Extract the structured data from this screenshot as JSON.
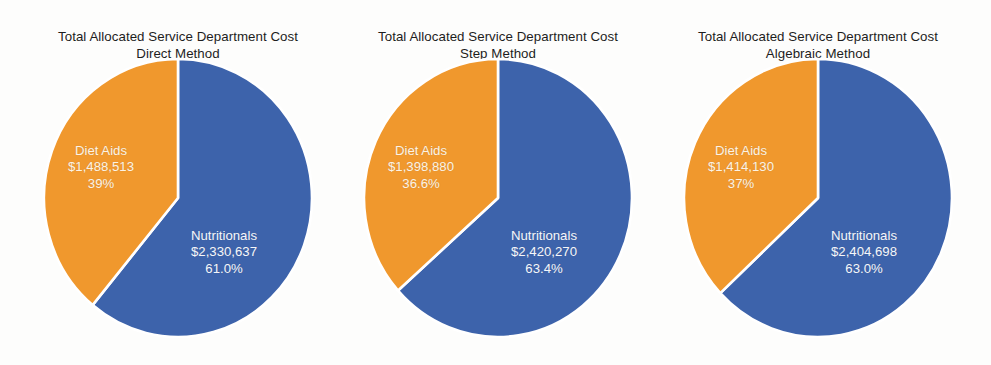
{
  "page": {
    "background": "#fdfdfc",
    "colors": {
      "nutritionals": "#3d63ab",
      "diet_aids": "#f0982d",
      "separator": "#ffffff",
      "title_text": "#1d1d1d",
      "label_text": "#ffffff"
    }
  },
  "chart_data": [
    {
      "type": "pie",
      "title": "Total Allocated Service Department Cost",
      "subtitle": "Direct Method",
      "start_angle_deg": 0,
      "direction": "clockwise",
      "center": {
        "cx": 165,
        "cy": 198
      },
      "radius": {
        "rx": 134,
        "ry": 139
      },
      "labels": [
        "Nutritionals",
        "Diet Aids"
      ],
      "values": [
        2330637,
        1488513
      ],
      "value_labels": [
        "$2,330,637",
        "$1,488,513"
      ],
      "percent_labels": [
        "61.0%",
        "39%"
      ],
      "percents": [
        61.0,
        39.0
      ],
      "colors": [
        "#3d63ab",
        "#f0982d"
      ],
      "label_positions": [
        {
          "x": 178,
          "y": 228
        },
        {
          "x": 55,
          "y": 143
        }
      ]
    },
    {
      "type": "pie",
      "title": "Total Allocated Service Department Cost",
      "subtitle": "Step Method",
      "start_angle_deg": 0,
      "direction": "clockwise",
      "center": {
        "cx": 165,
        "cy": 198
      },
      "radius": {
        "rx": 134,
        "ry": 139
      },
      "labels": [
        "Nutritionals",
        "Diet Aids"
      ],
      "values": [
        2420270,
        1398880
      ],
      "value_labels": [
        "$2,420,270",
        "$1,398,880"
      ],
      "percent_labels": [
        "63.4%",
        "36.6%"
      ],
      "percents": [
        63.4,
        36.6
      ],
      "colors": [
        "#3d63ab",
        "#f0982d"
      ],
      "label_positions": [
        {
          "x": 178,
          "y": 228
        },
        {
          "x": 55,
          "y": 143
        }
      ]
    },
    {
      "type": "pie",
      "title": "Total Allocated Service Department Cost",
      "subtitle": "Algebraic Method",
      "start_angle_deg": 0,
      "direction": "clockwise",
      "center": {
        "cx": 165,
        "cy": 198
      },
      "radius": {
        "rx": 134,
        "ry": 139
      },
      "labels": [
        "Nutritionals",
        "Diet Aids"
      ],
      "values": [
        2404698,
        1414130
      ],
      "value_labels": [
        "$2,404,698",
        "$1,414,130"
      ],
      "percent_labels": [
        "63.0%",
        "37%"
      ],
      "percents": [
        63.0,
        37.0
      ],
      "colors": [
        "#3d63ab",
        "#f0982d"
      ],
      "label_positions": [
        {
          "x": 178,
          "y": 228
        },
        {
          "x": 55,
          "y": 143
        }
      ]
    }
  ]
}
